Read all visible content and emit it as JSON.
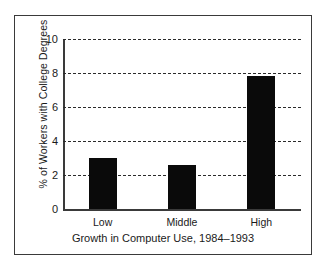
{
  "chart_data": {
    "type": "bar",
    "title": "",
    "categories": [
      "Low",
      "Middle",
      "High"
    ],
    "values": [
      3.0,
      2.6,
      7.8
    ],
    "xlabel": "Growth in Computer Use, 1984–1993",
    "ylabel": "% of Workers with College Degrees",
    "ylim": [
      0,
      10
    ],
    "yticks": [
      0,
      2,
      4,
      6,
      8,
      10
    ],
    "ytick_labels": [
      "0",
      "2",
      "4",
      "6",
      "8",
      "10"
    ],
    "grid": "horizontal-dashed",
    "legend": "none",
    "bar_color": "#0a0a0a",
    "background_color": "#ffffff",
    "frame_color": "#3a3a3a"
  }
}
